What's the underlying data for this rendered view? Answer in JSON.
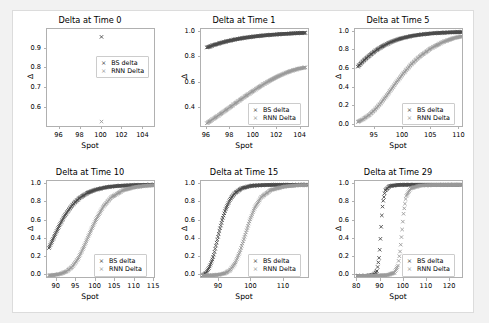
{
  "figure": {
    "background": "#ffffff",
    "page_background": "#f2f2f2",
    "series_colors": {
      "bs": "#4a4a4a",
      "rnn": "#9a9a9a"
    },
    "legend": {
      "bs_label": "BS delta",
      "rnn_label": "RNN Delta",
      "marker": "×"
    }
  },
  "chart_data": [
    {
      "type": "scatter",
      "title": "Delta at Time 0",
      "xlabel": "Spot",
      "ylabel": "Δ",
      "xlim": [
        94.8,
        105.2
      ],
      "ylim": [
        0.5,
        1.0
      ],
      "xticks": [
        96,
        98,
        100,
        102,
        104
      ],
      "yticks": [
        0.6,
        0.7,
        0.8,
        0.9
      ],
      "xtick_labels": [
        "96",
        "98",
        "100",
        "102",
        "104"
      ],
      "ytick_labels": [
        "0.6",
        "0.7",
        "0.8",
        "0.9"
      ],
      "grid": false,
      "legend_position": "center-right",
      "series": [
        {
          "name": "BS delta",
          "color": "#4a4a4a",
          "x": [
            100
          ],
          "y": [
            0.96
          ]
        },
        {
          "name": "RNN Delta",
          "color": "#9a9a9a",
          "x": [
            100
          ],
          "y": [
            0.53
          ]
        }
      ]
    },
    {
      "type": "scatter",
      "title": "Delta at Time 1",
      "xlabel": "Spot",
      "ylabel": "Δ",
      "xlim": [
        95.5,
        104.8
      ],
      "ylim": [
        0.25,
        1.02
      ],
      "xticks": [
        96,
        98,
        100,
        102,
        104
      ],
      "yticks": [
        0.4,
        0.6,
        0.8,
        1.0
      ],
      "xtick_labels": [
        "96",
        "98",
        "100",
        "102",
        "104"
      ],
      "ytick_labels": [
        "0.4",
        "0.6",
        "0.8",
        "1.0"
      ],
      "grid": false,
      "legend_position": "lower-right",
      "series": [
        {
          "name": "BS delta",
          "color": "#4a4a4a",
          "x": [
            96.0,
            96.6,
            97.2,
            97.8,
            98.4,
            99.0,
            99.6,
            100.2,
            100.8,
            101.4,
            102.0,
            102.6,
            103.2,
            103.8,
            104.4
          ],
          "y": [
            0.875,
            0.895,
            0.912,
            0.926,
            0.938,
            0.948,
            0.956,
            0.963,
            0.969,
            0.974,
            0.978,
            0.982,
            0.985,
            0.988,
            0.99
          ]
        },
        {
          "name": "RNN Delta",
          "color": "#9a9a9a",
          "x": [
            96.0,
            96.6,
            97.2,
            97.8,
            98.4,
            99.0,
            99.6,
            100.2,
            100.8,
            101.4,
            102.0,
            102.6,
            103.2,
            103.8,
            104.4
          ],
          "y": [
            0.283,
            0.32,
            0.358,
            0.397,
            0.437,
            0.476,
            0.514,
            0.551,
            0.586,
            0.618,
            0.647,
            0.672,
            0.693,
            0.709,
            0.72
          ]
        }
      ]
    },
    {
      "type": "scatter",
      "title": "Delta at Time 5",
      "xlabel": "Spot",
      "ylabel": "Δ",
      "xlim": [
        91.5,
        110.8
      ],
      "ylim": [
        -0.03,
        1.03
      ],
      "xticks": [
        95,
        100,
        105,
        110
      ],
      "yticks": [
        0.0,
        0.2,
        0.4,
        0.6,
        0.8,
        1.0
      ],
      "xtick_labels": [
        "95",
        "100",
        "105",
        "110"
      ],
      "ytick_labels": [
        "0.0",
        "0.2",
        "0.4",
        "0.6",
        "0.8",
        "1.0"
      ],
      "grid": false,
      "legend_position": "lower-right",
      "series": [
        {
          "name": "BS delta",
          "color": "#4a4a4a",
          "x": [
            92.0,
            93.0,
            94.0,
            95.0,
            96.0,
            97.0,
            98.0,
            99.0,
            100.0,
            101.5,
            103.0,
            105.0,
            107.0,
            109.0,
            110.5
          ],
          "y": [
            0.625,
            0.688,
            0.742,
            0.79,
            0.831,
            0.865,
            0.893,
            0.916,
            0.934,
            0.955,
            0.969,
            0.982,
            0.99,
            0.995,
            0.997
          ]
        },
        {
          "name": "RNN Delta",
          "color": "#9a9a9a",
          "x": [
            92.0,
            93.0,
            94.0,
            95.0,
            96.0,
            97.0,
            98.0,
            99.0,
            100.0,
            101.5,
            103.0,
            105.0,
            107.0,
            109.0,
            110.5
          ],
          "y": [
            0.03,
            0.062,
            0.105,
            0.16,
            0.228,
            0.305,
            0.388,
            0.47,
            0.548,
            0.652,
            0.736,
            0.824,
            0.888,
            0.932,
            0.952
          ]
        }
      ]
    },
    {
      "type": "scatter",
      "title": "Delta at Time 10",
      "xlabel": "Spot",
      "ylabel": "Δ",
      "xlim": [
        87.5,
        115.5
      ],
      "ylim": [
        -0.04,
        1.04
      ],
      "xticks": [
        90,
        95,
        100,
        105,
        110,
        115
      ],
      "yticks": [
        0.0,
        0.2,
        0.4,
        0.6,
        0.8,
        1.0
      ],
      "xtick_labels": [
        "90",
        "95",
        "100",
        "105",
        "110",
        "115"
      ],
      "ytick_labels": [
        "0.0",
        "0.2",
        "0.4",
        "0.6",
        "0.8",
        "1.0"
      ],
      "grid": false,
      "legend_position": "lower-right",
      "series": [
        {
          "name": "BS delta",
          "color": "#4a4a4a",
          "x": [
            88.0,
            89.0,
            90.0,
            91.0,
            92.0,
            93.0,
            94.5,
            96.0,
            98.0,
            100.0,
            103.0,
            106.0,
            110.0,
            113.0,
            115.0
          ],
          "y": [
            0.305,
            0.398,
            0.492,
            0.578,
            0.655,
            0.72,
            0.8,
            0.858,
            0.912,
            0.945,
            0.974,
            0.987,
            0.995,
            0.998,
            0.999
          ]
        },
        {
          "name": "RNN Delta",
          "color": "#9a9a9a",
          "x": [
            88.0,
            89.5,
            91.0,
            92.5,
            94.0,
            95.5,
            97.0,
            98.5,
            100.0,
            102.0,
            104.0,
            107.0,
            110.0,
            113.0,
            115.0
          ],
          "y": [
            0.005,
            0.01,
            0.022,
            0.048,
            0.1,
            0.19,
            0.32,
            0.47,
            0.61,
            0.762,
            0.86,
            0.938,
            0.972,
            0.988,
            0.993
          ]
        }
      ]
    },
    {
      "type": "scatter",
      "title": "Delta at Time 15",
      "xlabel": "Spot",
      "ylabel": "Δ",
      "xlim": [
        84.5,
        118.0
      ],
      "ylim": [
        -0.04,
        1.04
      ],
      "xticks": [
        90,
        100,
        110
      ],
      "yticks": [
        0.0,
        0.2,
        0.4,
        0.6,
        0.8,
        1.0
      ],
      "xtick_labels": [
        "90",
        "100",
        "110"
      ],
      "ytick_labels": [
        "0.0",
        "0.2",
        "0.4",
        "0.6",
        "0.8",
        "1.0"
      ],
      "grid": false,
      "legend_position": "lower-right",
      "series": [
        {
          "name": "BS delta",
          "color": "#4a4a4a",
          "x": [
            85.0,
            86.0,
            87.0,
            88.0,
            88.5,
            89.0,
            90.0,
            91.0,
            92.0,
            93.5,
            95.0,
            97.0,
            100.0,
            105.0,
            112.0,
            117.0
          ],
          "y": [
            0.005,
            0.03,
            0.09,
            0.18,
            0.24,
            0.32,
            0.47,
            0.61,
            0.725,
            0.842,
            0.91,
            0.96,
            0.988,
            0.997,
            0.999,
            1.0
          ]
        },
        {
          "name": "RNN Delta",
          "color": "#9a9a9a",
          "x": [
            85.0,
            88.0,
            90.0,
            92.0,
            93.5,
            95.0,
            96.5,
            98.0,
            99.5,
            101.0,
            103.0,
            106.0,
            110.0,
            114.0,
            117.0
          ],
          "y": [
            0.002,
            0.006,
            0.012,
            0.03,
            0.065,
            0.14,
            0.27,
            0.44,
            0.61,
            0.745,
            0.862,
            0.942,
            0.978,
            0.992,
            0.996
          ]
        }
      ]
    },
    {
      "type": "scatter",
      "title": "Delta at Time 29",
      "xlabel": "Spot",
      "ylabel": "Δ",
      "xlim": [
        79.0,
        126.0
      ],
      "ylim": [
        -0.04,
        1.04
      ],
      "xticks": [
        80,
        90,
        100,
        110,
        120
      ],
      "yticks": [
        0.0,
        0.2,
        0.4,
        0.6,
        0.8,
        1.0
      ],
      "xtick_labels": [
        "80",
        "90",
        "100",
        "110",
        "120"
      ],
      "ytick_labels": [
        "0.0",
        "0.2",
        "0.4",
        "0.6",
        "0.8",
        "1.0"
      ],
      "grid": false,
      "legend_position": "lower-right",
      "series": [
        {
          "name": "BS delta",
          "color": "#4a4a4a",
          "x": [
            80.0,
            84.0,
            87.0,
            88.5,
            89.5,
            90.0,
            90.5,
            91.0,
            92.0,
            94.0,
            98.0,
            105.0,
            113.0,
            120.0,
            125.0
          ],
          "y": [
            0.0,
            0.001,
            0.01,
            0.055,
            0.22,
            0.42,
            0.64,
            0.8,
            0.935,
            0.985,
            0.998,
            1.0,
            1.0,
            1.0,
            1.0
          ]
        },
        {
          "name": "RNN Delta",
          "color": "#9a9a9a",
          "x": [
            80.0,
            88.0,
            93.0,
            96.0,
            97.5,
            98.5,
            99.3,
            100.0,
            101.0,
            103.0,
            107.0,
            113.0,
            119.0,
            123.0,
            125.0
          ],
          "y": [
            0.0,
            0.002,
            0.008,
            0.035,
            0.11,
            0.28,
            0.5,
            0.7,
            0.87,
            0.96,
            0.99,
            0.997,
            0.999,
            1.0,
            1.0
          ]
        }
      ]
    }
  ]
}
